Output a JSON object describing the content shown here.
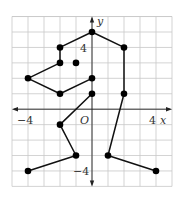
{
  "figure": {
    "type": "coordinate-grid-figure",
    "axes": {
      "x_label": "x",
      "y_label": "y",
      "origin_label": "O",
      "x_range": [
        -5,
        5
      ],
      "y_range": [
        -5,
        6
      ],
      "tick_labels": {
        "x_neg": "−4",
        "x_pos": "4",
        "y_pos": "4",
        "y_neg": "−4"
      }
    },
    "polylines": [
      {
        "name": "outline-upper",
        "points": [
          [
            0,
            2
          ],
          [
            -2,
            1
          ],
          [
            -4,
            2
          ],
          [
            -2,
            3
          ],
          [
            -2,
            4
          ],
          [
            0,
            5
          ],
          [
            2,
            4
          ],
          [
            2,
            1
          ],
          [
            1,
            -3
          ],
          [
            4,
            -4
          ]
        ]
      },
      {
        "name": "outline-lower-left",
        "points": [
          [
            0,
            1
          ],
          [
            -2,
            -1
          ],
          [
            -1,
            -3
          ],
          [
            -4,
            -4
          ]
        ]
      }
    ],
    "isolated_points": [
      [
        -1,
        3
      ]
    ],
    "colors": {
      "grid": "#c8c8c8",
      "line": "#111111",
      "point": "#000000",
      "axis": "#222222"
    }
  }
}
